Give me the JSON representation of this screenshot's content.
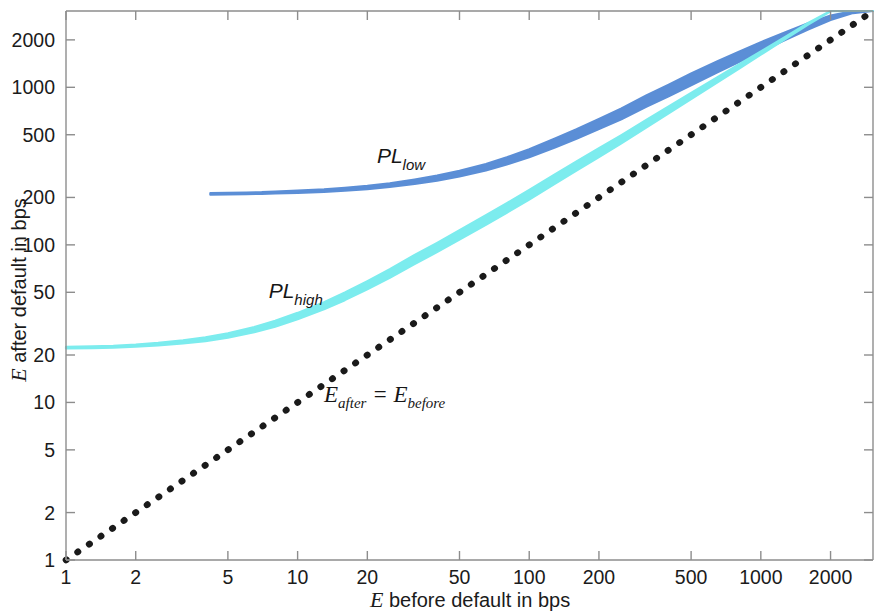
{
  "chart_data": {
    "type": "line",
    "title": "",
    "subtitle": "",
    "xlabel_italic": "E",
    "xlabel_rest": " before default in bps",
    "ylabel_italic": "E",
    "ylabel_rest": " after default in bps",
    "xscale": "log",
    "yscale": "log",
    "xlim": [
      1,
      3050
    ],
    "ylim": [
      1,
      3050
    ],
    "grid": false,
    "legend_position": "inline-annotations",
    "x_ticks": [
      1,
      2,
      5,
      10,
      20,
      50,
      100,
      200,
      500,
      1000,
      2000
    ],
    "x_tick_labels": [
      "1",
      "2",
      "5",
      "10",
      "20",
      "50",
      "100",
      "200",
      "500",
      "1000",
      "2000"
    ],
    "y_ticks": [
      1,
      2,
      5,
      10,
      20,
      50,
      100,
      200,
      500,
      1000,
      2000
    ],
    "y_tick_labels": [
      "1",
      "2",
      "5",
      "10",
      "20",
      "50",
      "100",
      "200",
      "500",
      "1000",
      "2000"
    ],
    "colors": {
      "pl_low": "#5b8ed6",
      "pl_high": "#7cecee",
      "identity": "#1a1a1a",
      "axis": "#8d8d8d",
      "text": "#1b1b1b",
      "background": "#ffffff"
    },
    "annotations": [
      {
        "name": "pl-low-label",
        "main": "PL",
        "sub": "low",
        "x": 22,
        "y": 330
      },
      {
        "name": "pl-high-label",
        "main": "PL",
        "sub": "high",
        "x": 7.5,
        "y": 46
      },
      {
        "name": "identity-line-label",
        "main_1": "E",
        "sub_1": "after",
        "operator": " = ",
        "main_2": "E",
        "sub_2": "before",
        "x": 13,
        "y": 10
      }
    ],
    "series": [
      {
        "name": "PL_low",
        "label": "PL low",
        "color": "#5b8ed6",
        "style": "band",
        "x_start": 4.2,
        "x_end": 3050,
        "x": [
          4.2,
          5,
          6,
          7,
          8,
          10,
          13,
          16,
          20,
          25,
          32,
          40,
          50,
          65,
          80,
          100,
          130,
          160,
          200,
          250,
          320,
          400,
          500,
          650,
          800,
          1000,
          1300,
          1600,
          2000,
          2500,
          3050
        ],
        "y_lower": [
          208,
          209,
          210,
          211,
          212,
          214,
          217,
          221,
          226,
          233,
          244,
          256,
          272,
          297,
          324,
          360,
          417,
          471,
          543,
          628,
          752,
          878,
          1032,
          1246,
          1441,
          1690,
          2026,
          2331,
          2676,
          2960,
          3050
        ],
        "y_upper": [
          213,
          214,
          215,
          216,
          218,
          221,
          225,
          230,
          237,
          246,
          260,
          275,
          295,
          326,
          360,
          404,
          474,
          541,
          630,
          734,
          886,
          1040,
          1224,
          1466,
          1678,
          1934,
          2260,
          2546,
          2854,
          3050,
          3050
        ]
      },
      {
        "name": "PL_high",
        "label": "PL high",
        "color": "#7cecee",
        "style": "band",
        "x_start": 1,
        "x_end": 3050,
        "x": [
          1,
          1.3,
          1.6,
          2,
          2.5,
          3.2,
          4,
          5,
          6.5,
          8,
          10,
          13,
          16,
          20,
          25,
          32,
          40,
          50,
          65,
          80,
          100,
          130,
          160,
          200,
          250,
          320,
          400,
          500,
          650,
          800,
          1000,
          1300,
          1600,
          2000,
          2500,
          3050
        ],
        "y_lower": [
          22.0,
          22.1,
          22.3,
          22.6,
          23.0,
          23.7,
          24.5,
          25.8,
          27.9,
          30.3,
          33.7,
          39.0,
          44.6,
          52.2,
          61.8,
          75.6,
          90.0,
          108,
          134,
          160,
          194,
          246,
          296,
          361,
          441,
          556,
          683,
          842,
          1076,
          1306,
          1611,
          2060,
          2500,
          3040,
          3050,
          3050
        ],
        "y_upper": [
          22.5,
          22.7,
          22.9,
          23.3,
          23.9,
          24.8,
          25.9,
          27.5,
          30.1,
          33.0,
          37.0,
          43.2,
          49.8,
          58.8,
          70.0,
          86.3,
          103,
          124,
          154,
          184,
          223,
          282,
          338,
          410,
          497,
          620,
          755,
          920,
          1160,
          1390,
          1690,
          2130,
          2560,
          3050,
          3050,
          3050
        ]
      },
      {
        "name": "E_after_equals_E_before",
        "label": "E after = E before",
        "color": "#1a1a1a",
        "style": "dotted",
        "x": [
          1,
          3050
        ],
        "y": [
          1,
          3050
        ]
      }
    ]
  },
  "axes": {
    "x_title_italic": "E",
    "x_title_rest": " before default in bps",
    "y_title_italic": "E",
    "y_title_rest": " after default in bps"
  }
}
